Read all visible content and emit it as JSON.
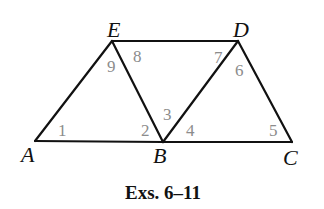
{
  "figure": {
    "caption": "Exs. 6–11",
    "colors": {
      "lines": "#111111",
      "vertex_labels": "#111111",
      "angle_labels": "#8c8c8c",
      "background": "#ffffff"
    },
    "vertices": {
      "A": {
        "label": "A",
        "x": 35,
        "y": 141
      },
      "B": {
        "label": "B",
        "x": 163,
        "y": 142
      },
      "C": {
        "label": "C",
        "x": 292,
        "y": 142
      },
      "D": {
        "label": "D",
        "x": 238,
        "y": 41
      },
      "E": {
        "label": "E",
        "x": 112,
        "y": 41
      }
    },
    "segments": [
      [
        "A",
        "B"
      ],
      [
        "B",
        "C"
      ],
      [
        "E",
        "D"
      ],
      [
        "A",
        "E"
      ],
      [
        "E",
        "B"
      ],
      [
        "B",
        "D"
      ],
      [
        "D",
        "C"
      ]
    ],
    "angles": [
      {
        "label": "1",
        "vertex": "A"
      },
      {
        "label": "2",
        "vertex": "B"
      },
      {
        "label": "3",
        "vertex": "B"
      },
      {
        "label": "4",
        "vertex": "B"
      },
      {
        "label": "5",
        "vertex": "C"
      },
      {
        "label": "6",
        "vertex": "D"
      },
      {
        "label": "7",
        "vertex": "D"
      },
      {
        "label": "8",
        "vertex": "E"
      },
      {
        "label": "9",
        "vertex": "E"
      }
    ]
  }
}
